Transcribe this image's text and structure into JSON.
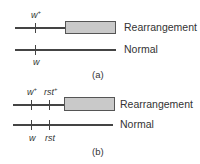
{
  "panels": [
    {
      "caption": "(a)",
      "rearrangement_label": "Rearrangement",
      "normal_label": "Normal",
      "top_genes": [
        {
          "name": "w",
          "sup": "+"
        }
      ],
      "bottom_genes": [
        {
          "name": "w",
          "sup": ""
        }
      ]
    },
    {
      "caption": "(b)",
      "rearrangement_label": "Rearrangement",
      "normal_label": "Normal",
      "top_genes": [
        {
          "name": "w",
          "sup": "+"
        },
        {
          "name": "rst",
          "sup": "+"
        }
      ],
      "bottom_genes": [
        {
          "name": "w",
          "sup": ""
        },
        {
          "name": "rst",
          "sup": ""
        }
      ]
    }
  ],
  "colors": {
    "line": "#444444",
    "box_fill": "#c9c9c9",
    "box_border": "#555555"
  }
}
